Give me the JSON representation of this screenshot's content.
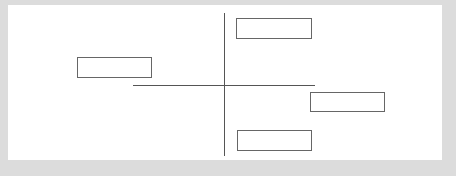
{
  "diagram": {
    "background_color": "#dcdcdc",
    "panel_color": "#ffffff",
    "line_color": "#555555",
    "box_border_color": "#666666",
    "axes": {
      "vertical": {
        "x": 224,
        "y_start": 13,
        "y_end": 156
      },
      "horizontal": {
        "y": 85,
        "x_start": 133,
        "x_end": 315
      }
    },
    "boxes": [
      {
        "id": "top-right",
        "label": ""
      },
      {
        "id": "left",
        "label": ""
      },
      {
        "id": "middle-right",
        "label": ""
      },
      {
        "id": "bottom-right",
        "label": ""
      }
    ]
  }
}
